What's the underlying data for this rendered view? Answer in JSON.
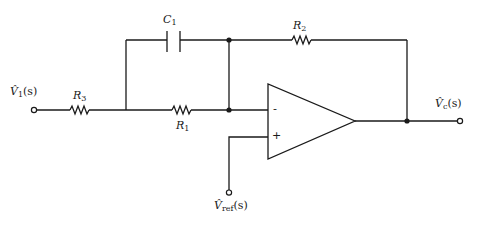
{
  "diagram": {
    "type": "circuit-schematic",
    "colors": {
      "ink": "#1a1a1a",
      "background": "#ffffff"
    },
    "components": {
      "C1": {
        "label": "C",
        "sub": "1",
        "kind": "capacitor"
      },
      "R1": {
        "label": "R",
        "sub": "1",
        "kind": "resistor"
      },
      "R2": {
        "label": "R",
        "sub": "2",
        "kind": "resistor"
      },
      "R3": {
        "label": "R",
        "sub": "3",
        "kind": "resistor"
      },
      "opamp": {
        "kind": "operational-amplifier",
        "inverting": "-",
        "non_inverting": "+"
      }
    },
    "terminals": {
      "input": {
        "label": "V̂",
        "sub": "1",
        "arg": "(s)"
      },
      "output": {
        "label": "V̂",
        "sub": "c",
        "arg": "(s)"
      },
      "reference": {
        "label": "V̂",
        "sub": "ref",
        "arg": "(s)"
      }
    }
  }
}
